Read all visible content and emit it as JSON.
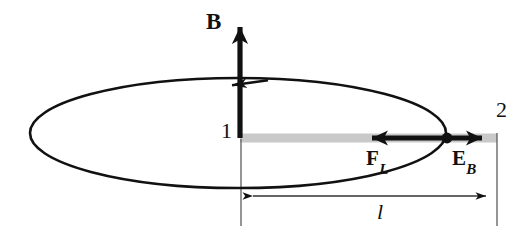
{
  "figure": {
    "background_color": "#ffffff",
    "stroke_color": "#111111",
    "rod_color": "#c9c9c9",
    "width": 530,
    "height": 232,
    "labels": {
      "magnetic_field": "B",
      "terminal_left": "1",
      "terminal_right": "2",
      "lorentz_force": "F",
      "lorentz_force_subscript": "L",
      "induced_field": "E",
      "induced_field_subscript": "B",
      "length": "l"
    },
    "elements": {
      "loop": {
        "name": "current-loop-ellipse",
        "shape": "ellipse",
        "center_x": 238,
        "center_y": 133,
        "radius_x": 208,
        "radius_y": 55,
        "current_direction": "counterclockwise"
      },
      "b_arrow": {
        "name": "magnetic-field-arrow",
        "direction": "up",
        "x": 240,
        "y_tail": 138,
        "y_head": 20
      },
      "rod": {
        "name": "conducting-rod",
        "x_start": 240,
        "x_end": 496,
        "y": 138
      },
      "lorentz_arrow": {
        "name": "lorentz-force-arrow",
        "direction": "left",
        "x_tail": 447,
        "x_head": 360,
        "y": 138
      },
      "induced_arrow": {
        "name": "induced-field-arrow",
        "direction": "right",
        "x_tail": 447,
        "x_head": 492,
        "y": 138
      },
      "charge_dot": {
        "name": "charge-carrier-dot",
        "x": 447,
        "y": 138,
        "radius": 5
      },
      "dimension": {
        "name": "length-dimension-line",
        "x_start": 243,
        "x_end": 496,
        "y": 196,
        "arrowheads": "both"
      },
      "guide_left": {
        "name": "left-extension-line",
        "x": 241,
        "y_start": 138,
        "y_end": 226
      },
      "guide_right": {
        "name": "right-extension-line",
        "x": 497,
        "y_start": 133,
        "y_end": 226
      }
    }
  }
}
